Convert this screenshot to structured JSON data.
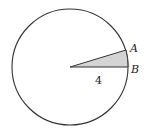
{
  "diagram": {
    "type": "circle-sector",
    "circle": {
      "cx": 70,
      "cy": 67,
      "r": 58,
      "stroke": "#333333",
      "fill": "#ffffff"
    },
    "sector": {
      "center": [
        70,
        67
      ],
      "point_a": [
        126,
        50
      ],
      "point_b": [
        128,
        67
      ],
      "fill": "#d4d4d4",
      "stroke": "#333333"
    },
    "labels": {
      "point_a": "A",
      "point_b": "B",
      "radius": "4"
    },
    "label_positions": {
      "point_a": [
        130,
        52
      ],
      "point_b": [
        131,
        73
      ],
      "radius": [
        95,
        84
      ]
    }
  }
}
